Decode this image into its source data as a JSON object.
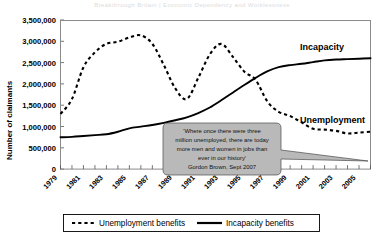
{
  "page": {
    "header_faint": "Breakthrough Britain  |  Economic Dependency and Worklessness"
  },
  "chart_data": {
    "type": "line",
    "title": "",
    "xlabel": "",
    "ylabel": "Number of claimants",
    "ylim": [
      0,
      3500000
    ],
    "xlim": [
      1979,
      2006
    ],
    "grid": false,
    "legend_position": "bottom",
    "ytick_labels": [
      "3,500,000",
      "3,000,000",
      "2,500,000",
      "2,000,000",
      "1,500,000",
      "1,000,000",
      "500,000",
      "0"
    ],
    "ytick_values": [
      3500000,
      3000000,
      2500000,
      2000000,
      1500000,
      1000000,
      500000,
      0
    ],
    "xtick_labels": [
      "1979",
      "1981",
      "1983",
      "1985",
      "1987",
      "1989",
      "1991",
      "1993",
      "1995",
      "1997",
      "1999",
      "2001",
      "2003",
      "2005"
    ],
    "xtick_values": [
      1979,
      1981,
      1983,
      1985,
      1987,
      1989,
      1991,
      1993,
      1995,
      1997,
      1999,
      2001,
      2003,
      2005
    ],
    "x": [
      1979,
      1980,
      1981,
      1982,
      1983,
      1984,
      1985,
      1986,
      1987,
      1988,
      1989,
      1990,
      1991,
      1992,
      1993,
      1994,
      1995,
      1996,
      1997,
      1998,
      1999,
      2000,
      2001,
      2002,
      2003,
      2004,
      2005,
      2006
    ],
    "series": [
      {
        "name": "Unemployment benefits",
        "style": "dashed",
        "color": "#000000",
        "annotation": "Unemployment",
        "values": [
          1300000,
          1650000,
          2400000,
          2750000,
          2950000,
          3000000,
          3100000,
          3150000,
          2950000,
          2450000,
          1900000,
          1650000,
          2150000,
          2700000,
          2950000,
          2650000,
          2300000,
          2100000,
          1600000,
          1350000,
          1250000,
          1100000,
          950000,
          930000,
          900000,
          840000,
          860000,
          880000
        ]
      },
      {
        "name": "Incapacity benefits",
        "style": "solid",
        "color": "#000000",
        "annotation": "Incapacity",
        "values": [
          750000,
          760000,
          780000,
          800000,
          820000,
          880000,
          960000,
          1000000,
          1040000,
          1090000,
          1150000,
          1220000,
          1320000,
          1450000,
          1620000,
          1800000,
          1980000,
          2150000,
          2300000,
          2400000,
          2450000,
          2480000,
          2520000,
          2560000,
          2580000,
          2590000,
          2600000,
          2610000
        ]
      }
    ],
    "callout": {
      "lines": [
        "'Where once there were three",
        "million unemployed, there are today",
        "more men and women in jobs than",
        "ever in our history'"
      ],
      "attribution": "Gordon Brown, Sept 2007"
    },
    "legend": [
      {
        "label": "Unemployment benefits",
        "style": "dashed"
      },
      {
        "label": "Incapacity benefits",
        "style": "solid"
      }
    ]
  }
}
